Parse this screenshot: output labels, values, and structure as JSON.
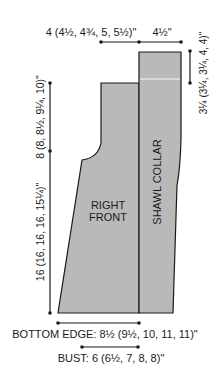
{
  "diagram": {
    "type": "knitting-schematic",
    "colors": {
      "fill": "#b9b9b9",
      "stroke": "#1a1a1a",
      "text": "#1a1a1a",
      "background": "#ffffff"
    },
    "pieces": {
      "right_front": {
        "line1": "RIGHT",
        "line2": "FRONT"
      },
      "shawl_collar": {
        "label": "SHAWL COLLAR"
      }
    },
    "dimensions": {
      "top_width": "4 (4½, 4¾, 5, 5½)\"",
      "collar_width": "4½\"",
      "collar_height": "3¼ (3¼, 3¼, 4, 4)\"",
      "armhole_depth": "8 (8, 8½, 9¼, 10)\"",
      "length_to_armhole": "16 (16, 16, 16, 15¼)\"",
      "bottom_edge": "BOTTOM EDGE: 8½ (9½, 10, 11, 11)\"",
      "bust": "BUST: 6 (6½, 7, 8, 8)\""
    }
  }
}
